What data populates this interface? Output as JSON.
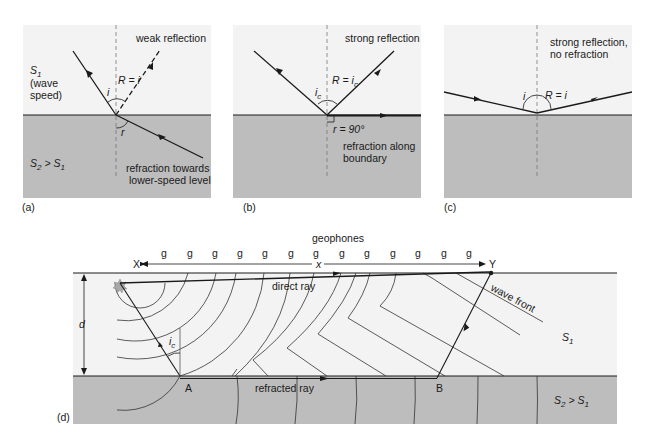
{
  "colors": {
    "upper_layer": "#f3f3f3",
    "lower_layer": "#bdbdbd",
    "line": "#1a1a1a",
    "star": "#a8a8a8"
  },
  "panels": {
    "a": {
      "tag": "(a)",
      "caption": "weak reflection",
      "upper_label": "S",
      "upper_sub": "1",
      "upper_note1": "(wave",
      "upper_note2": "speed)",
      "angle_i": "i",
      "angle_R": "R = i",
      "angle_r": "r",
      "lower_label": "S",
      "lower_sub2": "2",
      "lower_gt": " > S",
      "lower_sub1": "1",
      "refraction1": "refraction towards",
      "refraction2": "lower-speed level"
    },
    "b": {
      "tag": "(b)",
      "caption": "strong reflection",
      "angle_i": "i",
      "angle_i_sub": "c",
      "angle_R": "R = i",
      "angle_R_sub": "c",
      "angle_r": "r = 90°",
      "refraction1": "refraction along",
      "refraction2": "boundary"
    },
    "c": {
      "tag": "(c)",
      "caption1": "strong reflection,",
      "caption2": "no refraction",
      "angle_i": "i",
      "angle_R": "R = i"
    },
    "d": {
      "tag": "(d)",
      "title": "geophones",
      "geophone": "g",
      "geophone_count": 10,
      "point_X": "X",
      "point_Y": "Y",
      "distance": "x",
      "depth": "d",
      "direct_ray": "direct ray",
      "wave_front": "wave front",
      "angle_ic": "i",
      "angle_ic_sub": "c",
      "point_A": "A",
      "point_B": "B",
      "refracted_ray": "refracted ray",
      "upper_label": "S",
      "upper_sub": "1",
      "lower_label": "S",
      "lower_sub2": "2",
      "lower_gt": " > S",
      "lower_sub1": "1"
    }
  }
}
